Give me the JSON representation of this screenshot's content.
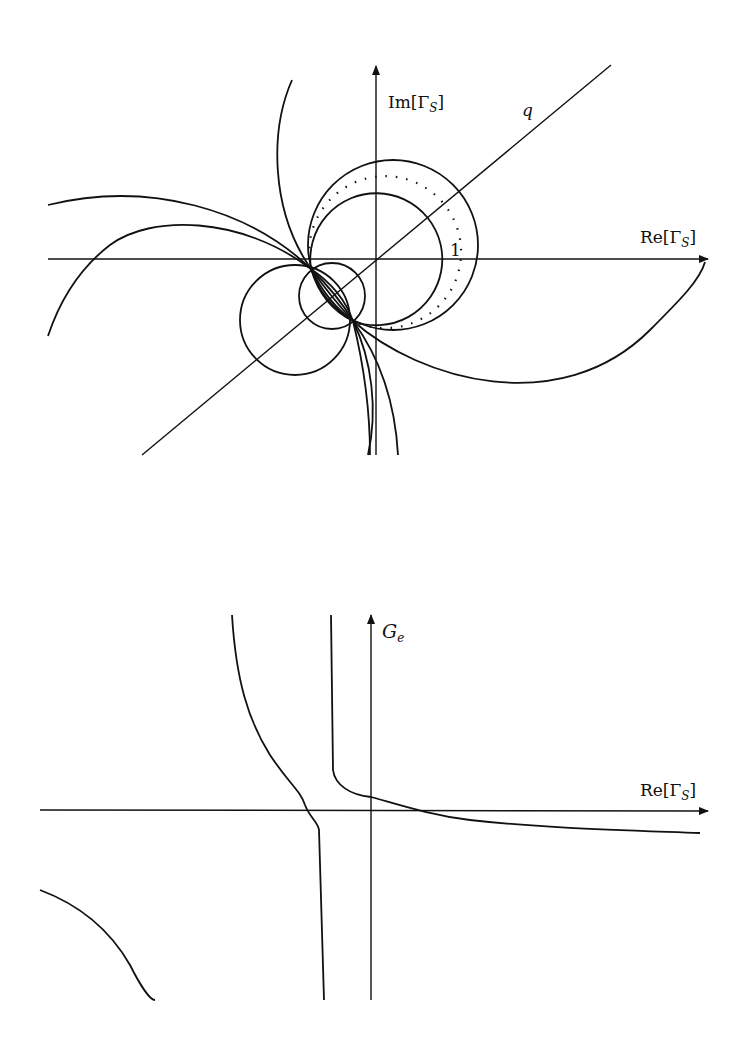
{
  "top_figure": {
    "axes": {
      "x_label_prefix": "Re[Γ",
      "x_label_sub": "S",
      "x_label_suffix": "]",
      "y_label_prefix": "Im[Γ",
      "y_label_sub": "S",
      "y_label_suffix": "]"
    },
    "line_label": "q",
    "unit_label": "1"
  },
  "bottom_figure": {
    "axes": {
      "x_label_prefix": "Re[Γ",
      "x_label_sub": "S",
      "x_label_suffix": "]",
      "y_label_main": "G",
      "y_label_sub": "e"
    }
  },
  "colors": {
    "ink": "#111111",
    "background": "#ffffff"
  }
}
